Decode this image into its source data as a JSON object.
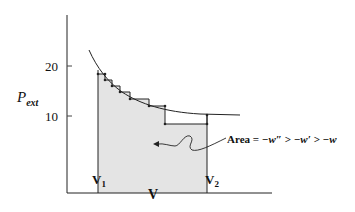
{
  "diagram": {
    "y_axis_label": "P",
    "y_axis_label_sub": "ext",
    "x_axis_label": "V",
    "y_ticks": [
      "20",
      "10"
    ],
    "x_ticks": [
      {
        "main": "V",
        "sub": "1"
      },
      {
        "main": "V",
        "sub": "2"
      }
    ],
    "annotation": {
      "text_prefix": "Area = ",
      "expr": "−w″ > −w′ > −w"
    },
    "colors": {
      "line": "#222222",
      "shade": "#e4e4e4"
    }
  }
}
